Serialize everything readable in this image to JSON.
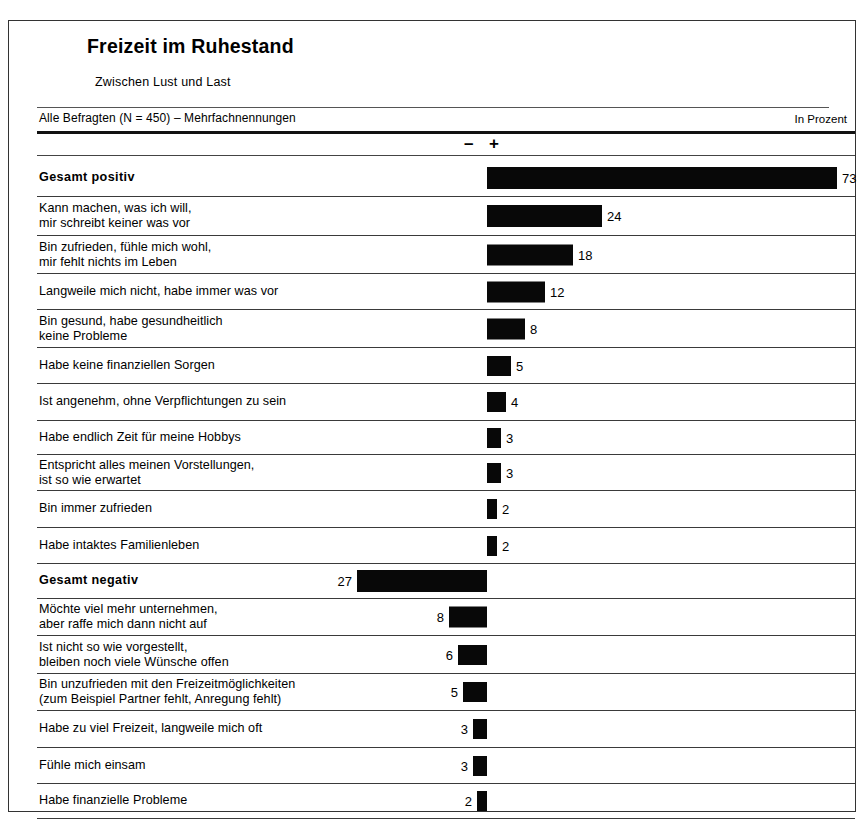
{
  "header": {
    "title": "Freizeit im Ruhestand",
    "subtitle": "Zwischen Lust und Last",
    "base_note": "Alle Befragten (N = 450) – Mehrfachnennungen",
    "unit_note": "In Prozent",
    "sign_negative": "–",
    "sign_positive": "+"
  },
  "chart_data": {
    "type": "bar",
    "title": "Freizeit im Ruhestand",
    "subtitle": "Zwischen Lust und Last",
    "xlabel": "",
    "ylabel": "",
    "unit": "In Prozent",
    "base": "Alle Befragten (N = 450) – Mehrfachnennungen",
    "orientation": "horizontal",
    "grid": false,
    "legend": "none",
    "xlim": [
      -30,
      75
    ],
    "px_per_unit": 4.8,
    "categories": [
      "Gesamt positiv",
      "Kann machen, was ich will,\nmir schreibt keiner was vor",
      "Bin zufrieden, fühle mich wohl,\nmir fehlt nichts im Leben",
      "Langweile mich nicht, habe immer was vor",
      "Bin gesund, habe gesundheitlich\nkeine Probleme",
      "Habe keine finanziellen Sorgen",
      "Ist angenehm, ohne Verpflichtungen zu sein",
      "Habe endlich Zeit für meine Hobbys",
      "Entspricht alles meinen Vorstellungen,\nist so wie erwartet",
      "Bin immer zufrieden",
      "Habe intaktes Familienleben",
      "Gesamt negativ",
      "Möchte viel mehr unternehmen,\naber raffe mich dann nicht auf",
      "Ist nicht so wie vorgestellt,\nbleiben noch viele Wünsche offen",
      "Bin unzufrieden mit den Freizeitmöglichkeiten\n(zum Beispiel Partner fehlt, Anregung fehlt)",
      "Habe zu viel Freizeit, langweile mich oft",
      "Fühle mich einsam",
      "Habe finanzielle Probleme"
    ],
    "values": [
      73,
      24,
      18,
      12,
      8,
      5,
      4,
      3,
      3,
      2,
      2,
      -27,
      -8,
      -6,
      -5,
      -3,
      -3,
      -2
    ]
  },
  "rows": [
    {
      "label": "Gesamt positiv",
      "value": "73",
      "magnitude": 73,
      "sign": "pos",
      "total": true,
      "top": 4,
      "height": 38
    },
    {
      "label": "Kann machen, was ich will,\nmir schreibt keiner was vor",
      "value": "24",
      "magnitude": 24,
      "sign": "pos",
      "total": false,
      "top": 42,
      "height": 39
    },
    {
      "label": "Bin zufrieden, fühle mich wohl,\nmir fehlt nichts im Leben",
      "value": "18",
      "magnitude": 18,
      "sign": "pos",
      "total": false,
      "top": 81,
      "height": 38
    },
    {
      "label": "Langweile mich nicht, habe immer was vor",
      "value": "12",
      "magnitude": 12,
      "sign": "pos",
      "total": false,
      "top": 119,
      "height": 36
    },
    {
      "label": "Bin gesund, habe gesundheitlich\nkeine Probleme",
      "value": "8",
      "magnitude": 8,
      "sign": "pos",
      "total": false,
      "top": 155,
      "height": 38
    },
    {
      "label": "Habe keine finanziellen Sorgen",
      "value": "5",
      "magnitude": 5,
      "sign": "pos",
      "total": false,
      "top": 193,
      "height": 36
    },
    {
      "label": "Ist angenehm, ohne Verpflichtungen zu sein",
      "value": "4",
      "magnitude": 4,
      "sign": "pos",
      "total": false,
      "top": 229,
      "height": 37
    },
    {
      "label": "Habe endlich Zeit für meine Hobbys",
      "value": "3",
      "magnitude": 3,
      "sign": "pos",
      "total": false,
      "top": 266,
      "height": 34
    },
    {
      "label": "Entspricht alles meinen Vorstellungen,\nist so wie erwartet",
      "value": "3",
      "magnitude": 3,
      "sign": "pos",
      "total": false,
      "top": 300,
      "height": 36
    },
    {
      "label": "Bin immer zufrieden",
      "value": "2",
      "magnitude": 2,
      "sign": "pos",
      "total": false,
      "top": 336,
      "height": 37
    },
    {
      "label": "Habe intaktes Familienleben",
      "value": "2",
      "magnitude": 2,
      "sign": "pos",
      "total": false,
      "top": 373,
      "height": 36
    },
    {
      "label": "Gesamt negativ",
      "value": "27",
      "magnitude": 27,
      "sign": "neg",
      "total": true,
      "top": 409,
      "height": 35
    },
    {
      "label": "Möchte viel mehr unternehmen,\naber raffe mich dann nicht auf",
      "value": "8",
      "magnitude": 8,
      "sign": "neg",
      "total": false,
      "top": 444,
      "height": 37
    },
    {
      "label": "Ist nicht so wie vorgestellt,\nbleiben noch viele Wünsche offen",
      "value": "6",
      "magnitude": 6,
      "sign": "neg",
      "total": false,
      "top": 481,
      "height": 38
    },
    {
      "label": "Bin unzufrieden mit den Freizeitmöglichkeiten\n(zum Beispiel Partner fehlt, Anregung fehlt)",
      "value": "5",
      "magnitude": 5,
      "sign": "neg",
      "total": false,
      "top": 519,
      "height": 37
    },
    {
      "label": "Habe zu viel Freizeit, langweile mich oft",
      "value": "3",
      "magnitude": 3,
      "sign": "neg",
      "total": false,
      "top": 556,
      "height": 37
    },
    {
      "label": "Fühle mich einsam",
      "value": "3",
      "magnitude": 3,
      "sign": "neg",
      "total": false,
      "top": 593,
      "height": 36
    },
    {
      "label": "Habe finanzielle Probleme",
      "value": "2",
      "magnitude": 2,
      "sign": "neg",
      "total": false,
      "top": 629,
      "height": 35
    }
  ]
}
